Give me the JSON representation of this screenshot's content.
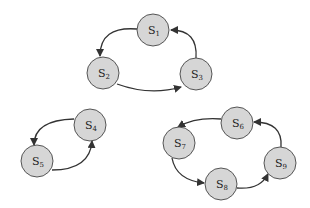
{
  "diagram": {
    "type": "state-cycles",
    "nodes": [
      {
        "id": "S1",
        "label": "S",
        "sub": "1",
        "x": 153,
        "y": 30
      },
      {
        "id": "S2",
        "label": "S",
        "sub": "2",
        "x": 103,
        "y": 73
      },
      {
        "id": "S3",
        "label": "S",
        "sub": "3",
        "x": 196,
        "y": 74
      },
      {
        "id": "S4",
        "label": "S",
        "sub": "4",
        "x": 90,
        "y": 125
      },
      {
        "id": "S5",
        "label": "S",
        "sub": "5",
        "x": 37,
        "y": 161
      },
      {
        "id": "S6",
        "label": "S",
        "sub": "6",
        "x": 237,
        "y": 123
      },
      {
        "id": "S7",
        "label": "S",
        "sub": "7",
        "x": 179,
        "y": 143
      },
      {
        "id": "S8",
        "label": "S",
        "sub": "8",
        "x": 221,
        "y": 184
      },
      {
        "id": "S9",
        "label": "S",
        "sub": "9",
        "x": 280,
        "y": 163
      }
    ],
    "edges": [
      {
        "from": "S1",
        "to": "S2"
      },
      {
        "from": "S2",
        "to": "S3"
      },
      {
        "from": "S3",
        "to": "S1"
      },
      {
        "from": "S4",
        "to": "S5"
      },
      {
        "from": "S5",
        "to": "S4"
      },
      {
        "from": "S6",
        "to": "S7"
      },
      {
        "from": "S7",
        "to": "S8"
      },
      {
        "from": "S8",
        "to": "S9"
      },
      {
        "from": "S9",
        "to": "S6"
      }
    ]
  }
}
